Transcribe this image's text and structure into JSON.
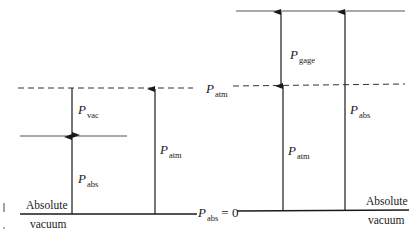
{
  "diagram": {
    "colors": {
      "line": "#1a1a1a",
      "dash": "#333333",
      "level": "#555555",
      "background": "#ffffff"
    },
    "left": {
      "labels": {
        "p_vac": {
          "symbol": "P",
          "sub": "vac"
        },
        "p_abs": {
          "symbol": "P",
          "sub": "abs"
        },
        "p_atm": {
          "symbol": "P",
          "sub": "atm"
        },
        "absolute": "Absolute",
        "vacuum": "vacuum"
      }
    },
    "center": {
      "p_atm": {
        "symbol": "P",
        "sub": "atm"
      },
      "p_abs_zero": {
        "symbol": "P",
        "sub": "abs",
        "suffix": "= 0"
      }
    },
    "right": {
      "labels": {
        "p_gage": {
          "symbol": "P",
          "sub": "gage"
        },
        "p_atm": {
          "symbol": "P",
          "sub": "atm"
        },
        "p_abs": {
          "symbol": "P",
          "sub": "abs"
        },
        "absolute": "Absolute",
        "vacuum": "vacuum"
      }
    }
  }
}
